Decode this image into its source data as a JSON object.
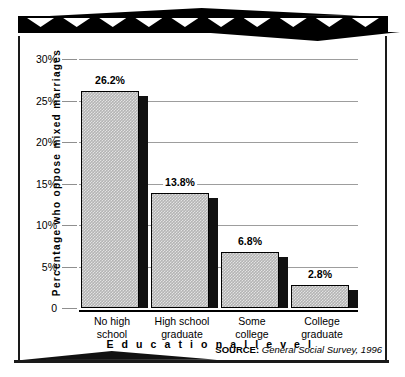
{
  "chart_data": {
    "type": "bar",
    "title": "",
    "xlabel": "E d u c a t i o n a l   l e v e l",
    "ylabel": "Percentage who oppose mixed marriages",
    "categories": [
      "No high school",
      "High school graduate",
      "Some college",
      "College graduate"
    ],
    "values": [
      26.2,
      13.8,
      6.8,
      2.8
    ],
    "value_labels": [
      "26.2%",
      "13.8%",
      "6.8%",
      "2.8%"
    ],
    "ylim": [
      0,
      30
    ],
    "yticks": [
      0,
      5,
      10,
      15,
      20,
      25,
      30
    ],
    "ytick_labels": [
      "0",
      "5%",
      "10%",
      "15%",
      "20%",
      "25%",
      "30%"
    ],
    "grid": "horizontal",
    "legend": "none",
    "bar_fill_color": "#b4b4b4",
    "bar_edge_color": "#000000",
    "bar_shadow_color": "#111111",
    "gridline_color": "#9d9d9d"
  },
  "axis": {
    "y_title": "Percentage who oppose mixed marriages",
    "x_title": "Educational level",
    "ticks": [
      {
        "label": "30%",
        "value": 30
      },
      {
        "label": "25%",
        "value": 25
      },
      {
        "label": "20%",
        "value": 20
      },
      {
        "label": "15%",
        "value": 15
      },
      {
        "label": "10%",
        "value": 10
      },
      {
        "label": "5%",
        "value": 5
      },
      {
        "label": "0",
        "value": 0
      }
    ]
  },
  "bars": [
    {
      "value_label": "26.2%",
      "line1": "No high",
      "line2": "school"
    },
    {
      "value_label": "13.8%",
      "line1": "High school",
      "line2": "graduate"
    },
    {
      "value_label": "6.8%",
      "line1": "Some",
      "line2": "college"
    },
    {
      "value_label": "2.8%",
      "line1": "College",
      "line2": "graduate"
    }
  ],
  "source": {
    "key": "SOURCE:",
    "value": "General Social Survey, 1996"
  }
}
